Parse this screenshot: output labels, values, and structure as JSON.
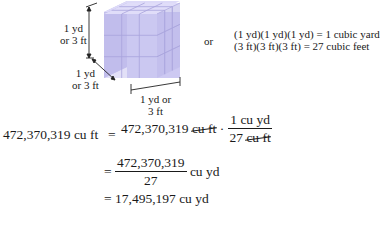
{
  "figure": {
    "cube": {
      "color_front": "#c9c6f0",
      "color_top": "#dcdaf7",
      "color_side": "#b4b0e6",
      "grid": "3x3x3"
    },
    "labels": {
      "height": [
        "1 yd",
        "or 3 ft"
      ],
      "depth": [
        "1 yd",
        "or 3 ft"
      ],
      "width": [
        "1 yd or",
        "3 ft"
      ]
    },
    "or_text": "or",
    "equations": {
      "line1": "(1 yd)(1 yd)(1 yd) = 1 cubic yard",
      "line2": "(3 ft)(3 ft)(3 ft) = 27 cubic feet"
    }
  },
  "conversion": {
    "lhs": "472,370,319 cu ft",
    "eq": "=",
    "step1": {
      "value": "472,370,319",
      "unit_cancelled": "cu ft",
      "dot": "·",
      "frac_num": "1 cu yd",
      "frac_den_value": "27",
      "frac_den_unit_cancelled": "cu ft"
    },
    "step2": {
      "frac_num": "472,370,319",
      "frac_den": "27",
      "unit": "cu yd"
    },
    "step3": {
      "result": "17,495,197 cu yd"
    }
  }
}
